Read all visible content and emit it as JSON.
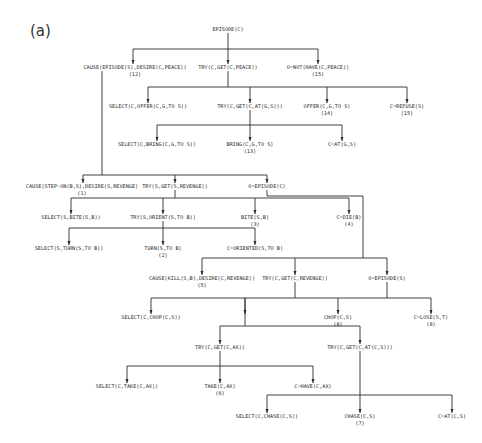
{
  "panel_label": "(a)",
  "nodes": {
    "root": {
      "text": "EPISODE(C)",
      "num": ""
    },
    "cause_episode": {
      "text": "CAUSE(EPISODE(S),DESIRE(C,PEACE))",
      "num": "(12)"
    },
    "try_peace": {
      "text": "TRY(C,GET(C,PEACE))",
      "num": ""
    },
    "o_not_have": {
      "text": "O=NOT(HAVE(C,PEACE))",
      "num": "(15)"
    },
    "select_offer": {
      "text": "SELECT(C,OFFER(C,G,TO S))",
      "num": ""
    },
    "try_at": {
      "text": "TRY(C,GET(C,AT(G,S)))",
      "num": ""
    },
    "offer": {
      "text": "OFFER(C,G,TO S)",
      "num": "(14)"
    },
    "c_refuse": {
      "text": "C=REFUSE(S)",
      "num": "(15)"
    },
    "select_bring": {
      "text": "SELECT(C,BRING(C,G,TO S))",
      "num": ""
    },
    "bring": {
      "text": "BRING(C,G,TO S)",
      "num": "(13)"
    },
    "c_at_gs": {
      "text": "C=AT(G,S)",
      "num": ""
    },
    "cause_stepon": {
      "text": "CAUSE(STEP-ON(B,S),DESIRE(S,REVENGE)",
      "num": "(1)"
    },
    "try_s_revenge": {
      "text": "TRY(S,GET(S,REVENGE))",
      "num": ""
    },
    "o_episode_c": {
      "text": "O=EPISODE(C)",
      "num": ""
    },
    "select_bite": {
      "text": "SELECT(S,BITE(S,B))",
      "num": ""
    },
    "try_orient": {
      "text": "TRY(S,ORIENT(S,TO B))",
      "num": ""
    },
    "bite": {
      "text": "BITE(S,B)",
      "num": "(3)"
    },
    "c_die": {
      "text": "C=DIE(B)",
      "num": "(4)"
    },
    "select_turn": {
      "text": "SELECT(S,TURN(S,TO B))",
      "num": ""
    },
    "turn": {
      "text": "TURN(S,TO B)",
      "num": "(2)"
    },
    "c_oriented": {
      "text": "C=ORIENTED(S,TO B)",
      "num": ""
    },
    "cause_kill": {
      "text": "CAUSE(KILL(S,B),DESIRE(C,REVENGE))",
      "num": "(5)"
    },
    "try_c_revenge": {
      "text": "TRY(C,GET(C,REVENGE))",
      "num": ""
    },
    "o_episode_s": {
      "text": "O=EPISODE(S)",
      "num": ""
    },
    "select_chop": {
      "text": "SELECT(C,CHOP(C,S))",
      "num": ""
    },
    "chop": {
      "text": "CHOP(C,S)",
      "num": "(8)"
    },
    "c_lose": {
      "text": "C=LOSE(S,T)",
      "num": "(8)"
    },
    "try_ax": {
      "text": "TRY(C,GET(C,AX))",
      "num": ""
    },
    "try_at_cs": {
      "text": "TRY(C,GET(C,AT(C,S)))",
      "num": ""
    },
    "select_take": {
      "text": "SELECT(C,TAKE(C,AX))",
      "num": ""
    },
    "take": {
      "text": "TAKE(C,AX)",
      "num": "(6)"
    },
    "c_have": {
      "text": "C=HAVE(C,AX)",
      "num": ""
    },
    "select_chase": {
      "text": "SELECT(C,CHASE(C,S))",
      "num": ""
    },
    "chase": {
      "text": "CHASE(C,S)",
      "num": "(7)"
    },
    "c_at_cs": {
      "text": "C=AT(C,S)",
      "num": ""
    }
  }
}
